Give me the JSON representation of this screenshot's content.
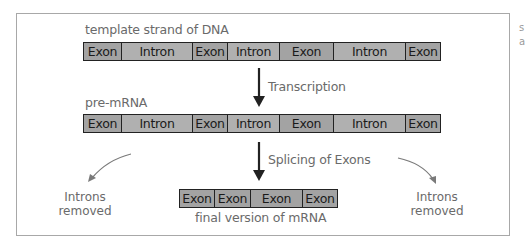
{
  "diagram": {
    "type": "flow",
    "title": "",
    "rows": [
      {
        "id": "dna",
        "label": "template strand of DNA",
        "segments": [
          {
            "type": "exon",
            "label": "Exon",
            "width": 38
          },
          {
            "type": "intron",
            "label": "Intron",
            "width": 71
          },
          {
            "type": "exon",
            "label": "Exon",
            "width": 35
          },
          {
            "type": "intron",
            "label": "Intron",
            "width": 52
          },
          {
            "type": "exon",
            "label": "Exon",
            "width": 54
          },
          {
            "type": "intron",
            "label": "Intron",
            "width": 72
          },
          {
            "type": "exon",
            "label": "Exon",
            "width": 34
          }
        ]
      },
      {
        "id": "pre-mrna",
        "label": "pre-mRNA",
        "segments": [
          {
            "type": "exon",
            "label": "Exon",
            "width": 38
          },
          {
            "type": "intron",
            "label": "Intron",
            "width": 71
          },
          {
            "type": "exon",
            "label": "Exon",
            "width": 35
          },
          {
            "type": "intron",
            "label": "Intron",
            "width": 52
          },
          {
            "type": "exon",
            "label": "Exon",
            "width": 54
          },
          {
            "type": "intron",
            "label": "Intron",
            "width": 72
          },
          {
            "type": "exon",
            "label": "Exon",
            "width": 34
          }
        ]
      },
      {
        "id": "final-mrna",
        "label": "final version of mRNA",
        "segments": [
          {
            "type": "exon",
            "label": "Exon",
            "width": 35
          },
          {
            "type": "exon",
            "label": "Exon",
            "width": 36
          },
          {
            "type": "exon",
            "label": "Exon",
            "width": 52
          },
          {
            "type": "exon",
            "label": "Exon",
            "width": 34
          }
        ]
      }
    ],
    "steps": [
      {
        "from": "dna",
        "to": "pre-mrna",
        "label": "Transcription"
      },
      {
        "from": "pre-mrna",
        "to": "final-mrna",
        "label": "Splicing of Exons"
      }
    ],
    "side_notes": {
      "left": {
        "line1": "Introns",
        "line2": "removed"
      },
      "right": {
        "line1": "Introns",
        "line2": "removed"
      }
    },
    "colors": {
      "exon_fill": "#a3a3a3",
      "intron_fill": "#b0b0b0",
      "stroke": "#222222",
      "label_text": "#6a6a6a",
      "frame": "#a8a8a8"
    }
  },
  "edge_fragments": {
    "line1": "s",
    "line2": "a"
  }
}
